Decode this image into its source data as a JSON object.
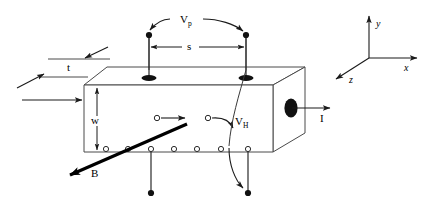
{
  "figure": {
    "background_color": "#ffffff",
    "line_color": "#3a3a3a",
    "bold_line_color": "#000000",
    "text_color": "#000000"
  },
  "labels": {
    "potential_probe": "V",
    "potential_probe_sub": "p",
    "hall_voltage": "V",
    "hall_voltage_sub": "H",
    "probe_spacing": "s",
    "thickness": "t",
    "width": "w",
    "magnetic_field": "B",
    "current": "I"
  },
  "axes": {
    "y": "y",
    "x": "x",
    "z": "z"
  },
  "sample": {
    "front_face_corners": "(84,85) (273,85) (273,152) (84,152)",
    "top_face_corners": "(84,85) (107,67) (305,67) (273,85)",
    "right_face_corners": "(273,85) (305,67) (305,133) (273,152)",
    "carrier_circle_count": 7,
    "top_contact_pad_count": 2,
    "bottom_lead_count": 2
  },
  "carriers": {
    "bottom_row_circles": 7,
    "interior_circles": 2
  }
}
